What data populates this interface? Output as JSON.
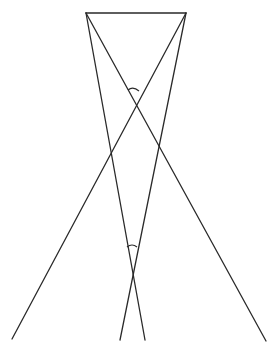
{
  "diagram": {
    "type": "geometric-figure",
    "stroke_color": "#2a2a2a",
    "background": "#ffffff",
    "points": {
      "A": [
        86,
        13
      ],
      "B": [
        186,
        13
      ],
      "P1": [
        12,
        339
      ],
      "P2": [
        120,
        340
      ],
      "P3": [
        145,
        340
      ],
      "P4": [
        266,
        341
      ]
    },
    "segments": [
      {
        "id": "top",
        "from": "A",
        "to": "B"
      },
      {
        "id": "a-to-p4",
        "from": "A",
        "to": "P4"
      },
      {
        "id": "a-to-p3",
        "from": "A",
        "to": "P3"
      },
      {
        "id": "b-to-p1",
        "from": "B",
        "to": "P1"
      },
      {
        "id": "b-to-p2",
        "from": "B",
        "to": "P2"
      }
    ],
    "angle_marks": [
      {
        "id": "upper-angle",
        "at": [
          135,
          101
        ],
        "arc_y": 90
      },
      {
        "id": "lower-angle",
        "at": [
          132,
          270
        ],
        "arc_y": 246
      }
    ]
  }
}
